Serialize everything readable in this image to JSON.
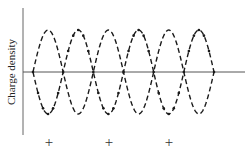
{
  "figure": {
    "ylabel": "Charge density",
    "charge_signs": [
      "+",
      "+",
      "+"
    ],
    "colors": {
      "curve": "#1a1a1a",
      "axis": "#555555",
      "text": "#222222"
    }
  },
  "chart_data": {
    "type": "line",
    "title": "",
    "xlabel": "",
    "ylabel": "Charge density",
    "grid": false,
    "legend": null,
    "x_range": [
      0,
      3
    ],
    "y_range": [
      -1,
      1
    ],
    "series": [
      {
        "name": "dashed-wave",
        "style": "dashed",
        "function": "sin(2*pi*x)",
        "periods": 3
      },
      {
        "name": "dash-dot-wave",
        "style": "dash-dot",
        "function": "-sin(2*pi*x)",
        "periods": 3
      }
    ],
    "annotations": [
      {
        "text": "+",
        "x": 0.25
      },
      {
        "text": "+",
        "x": 1.25
      },
      {
        "text": "+",
        "x": 2.25
      }
    ]
  }
}
